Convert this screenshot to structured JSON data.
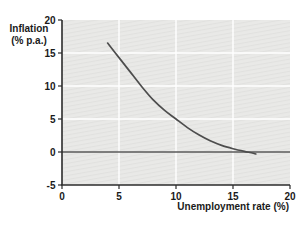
{
  "chart_data": {
    "type": "line",
    "title": "",
    "xlabel": "Unemployment rate (%)",
    "ylabel": "Inflation (% p.a.)",
    "ylabel_lines": [
      "Inflation",
      "(% p.a.)"
    ],
    "xlim": [
      0,
      20
    ],
    "ylim": [
      -5,
      20
    ],
    "xticks": [
      0,
      5,
      10,
      15,
      20
    ],
    "yticks": [
      -5,
      0,
      5,
      10,
      15,
      20
    ],
    "grid": true,
    "gridlines_x": [
      5,
      10,
      15
    ],
    "gridlines_y": [
      5,
      10,
      15
    ],
    "zero_line_y": 0,
    "legend_position": "none",
    "series": [
      {
        "name": "Phillips curve",
        "x": [
          4,
          5,
          6,
          7,
          8,
          9,
          10,
          11,
          12,
          13,
          14,
          15,
          16,
          17
        ],
        "y": [
          16.5,
          14.3,
          12.1,
          9.9,
          7.9,
          6.3,
          5.0,
          3.7,
          2.6,
          1.7,
          1.0,
          0.5,
          0.1,
          -0.3
        ],
        "color": "#4d4d4d"
      }
    ],
    "colors": {
      "plot_bg": "#e9e9e7",
      "plot_bg_hatch": "#e1e1df",
      "gridline": "#ffffff",
      "axis": "#2b2b2b",
      "zero_line": "#5a5a5a",
      "text": "#1a1a1a"
    }
  }
}
